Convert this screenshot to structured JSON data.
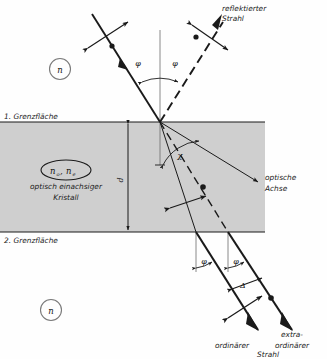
{
  "figure": {
    "background": "#fefefe",
    "ink": "#1a1a1a",
    "slab_fill": "#cfcfcf"
  },
  "media": {
    "outer_top": "n",
    "outer_bottom": "n",
    "crystal_index_o": "n",
    "crystal_index_o_sub": "o",
    "crystal_index_e": "n",
    "crystal_index_e_sub": "e",
    "separator": ",",
    "crystal_line1": "optisch einachsiger",
    "crystal_line2": "Kristall",
    "thickness_label": "d"
  },
  "boundaries": {
    "first": "1. Grenzfläche",
    "second": "2. Grenzfläche"
  },
  "rays": {
    "reflected_line1": "reflektierter",
    "reflected_line2": "Strahl",
    "optical_axis_line1": "optische",
    "optical_axis_line2": "Achse",
    "ordinary_line1": "ordinärer",
    "extraordinary_line1": "extra-",
    "extraordinary_line2": "ordinärer",
    "strahl": "Strahl"
  },
  "angles": {
    "incidence": "φ",
    "reflection": "φ",
    "axis_angle": "χ",
    "exit_left": "φ",
    "exit_right": "φ",
    "separation": "Δ"
  }
}
